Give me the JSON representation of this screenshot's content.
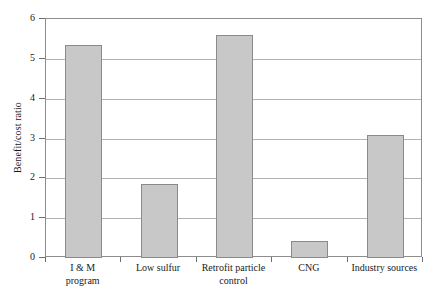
{
  "chart_data": {
    "type": "bar",
    "title": "",
    "xlabel": "",
    "ylabel": "Benefit/cost ratio",
    "categories": [
      "I & M\nprogram",
      "Low sulfur",
      "Retrofit particle\ncontrol",
      "CNG",
      "Industry sources"
    ],
    "values": [
      5.35,
      1.87,
      5.6,
      0.42,
      3.1
    ],
    "ylim": [
      0,
      6
    ],
    "yticks": [
      "0",
      "1",
      "2",
      "3",
      "4",
      "5",
      "6"
    ],
    "ytick_values": [
      0,
      1,
      2,
      3,
      4,
      5,
      6
    ],
    "grid": "horizontal",
    "legend": "none",
    "colors": {
      "bar_fill": "#c8c8c8",
      "bar_edge": "#8a8a8a",
      "gridline": "#b3b3b3",
      "frame": "#8d8d8d",
      "background": "#ffffff",
      "text": "#1a1a1a"
    }
  }
}
